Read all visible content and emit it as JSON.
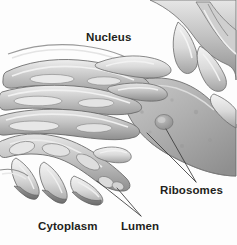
{
  "figure": {
    "background_color": "#fdfdfd",
    "label_color": "#231f20",
    "leader_line_color": "#3a3a3a",
    "membrane_fill_light": "#d8d8d8",
    "membrane_fill_mid": "#b2b2b2",
    "membrane_fill_dark": "#8a8a8a",
    "membrane_outline": "#5f5f5f",
    "lumen_highlight": "#f2f2f2"
  },
  "labels": {
    "nucleus": "Nucleus",
    "ribosomes": "Ribosomes",
    "cytoplasm": "Cytoplasm",
    "lumen": "Lumen"
  }
}
